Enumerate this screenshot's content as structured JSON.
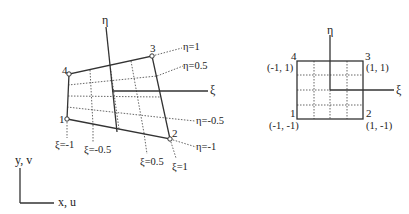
{
  "physical_element": {
    "nodes": [
      {
        "id": "1",
        "x": 67,
        "y": 119
      },
      {
        "id": "2",
        "x": 170,
        "y": 139
      },
      {
        "id": "3",
        "x": 152,
        "y": 56
      },
      {
        "id": "4",
        "x": 69,
        "y": 74
      }
    ],
    "eta_axis_label": "η",
    "xi_axis_label": "ξ",
    "eta_lines": [
      "η=1",
      "η=0.5",
      "η=-0.5",
      "η=-1"
    ],
    "xi_lines": [
      "ξ=-1",
      "ξ=-0.5",
      "ξ=0.5",
      "ξ=1"
    ]
  },
  "reference_element": {
    "nodes": [
      {
        "id": "1",
        "coords": "(-1, -1)"
      },
      {
        "id": "2",
        "coords": "(1, -1)"
      },
      {
        "id": "3",
        "coords": "(1, 1)"
      },
      {
        "id": "4",
        "coords": "(-1, 1)"
      }
    ],
    "eta_axis_label": "η",
    "xi_axis_label": "ξ"
  },
  "global_axes": {
    "vertical_label": "y, v",
    "horizontal_label": "x, u"
  }
}
